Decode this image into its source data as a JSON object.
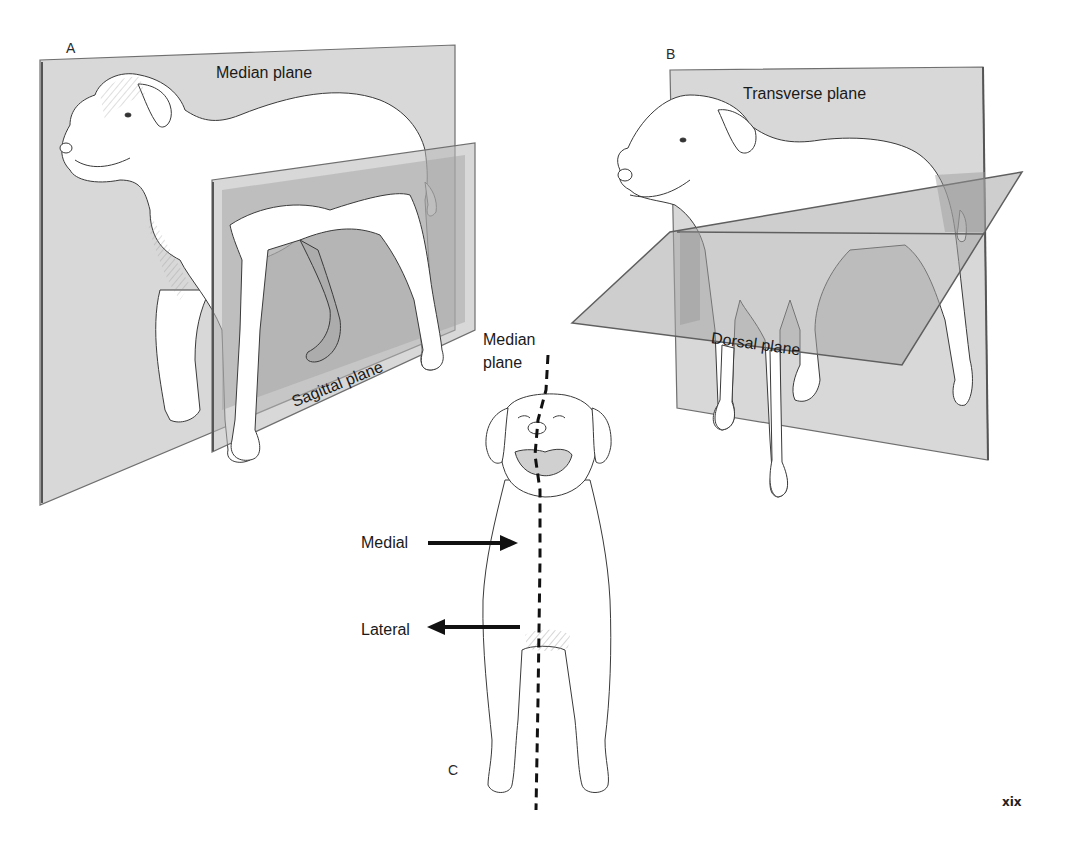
{
  "figure": {
    "panels": [
      {
        "id": "A",
        "letter": "A",
        "planes": [
          {
            "name": "median",
            "label": "Median plane"
          },
          {
            "name": "sagittal",
            "label": "Sagittal plane"
          }
        ]
      },
      {
        "id": "B",
        "letter": "B",
        "planes": [
          {
            "name": "transverse",
            "label": "Transverse plane"
          },
          {
            "name": "dorsal",
            "label": "Dorsal plane"
          }
        ]
      },
      {
        "id": "C",
        "letter": "C",
        "median_line_label_line1": "Median",
        "median_line_label_line2": "plane",
        "arrows": [
          {
            "name": "medial",
            "label": "Medial",
            "direction": "right"
          },
          {
            "name": "lateral",
            "label": "Lateral",
            "direction": "left"
          }
        ]
      }
    ],
    "page_number": "xix"
  },
  "colors": {
    "plane_light": "#d9d9d9",
    "plane_mid": "#c4c4c4",
    "plane_dark": "#a9a9a9",
    "plane_edge": "#6f6f6f",
    "outline": "#3a3a3a",
    "arrow": "#111111"
  }
}
